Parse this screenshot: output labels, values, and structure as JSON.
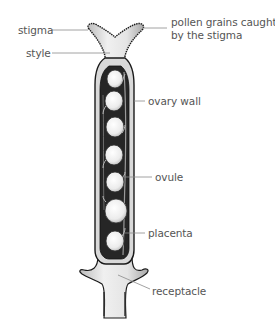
{
  "diagram": {
    "colors": {
      "outline": "#1a1a1a",
      "wall_dark": "#2a2a2a",
      "tissue_light": "#e8e8e8",
      "ovule_fill": "#f4f4f4",
      "leader_line": "#8a8a8a",
      "label_text": "#555555"
    },
    "labels": {
      "stigma": "stigma",
      "style": "style",
      "pollen_line1": "pollen grains caught",
      "pollen_line2": "by the stigma",
      "ovary_wall": "ovary wall",
      "ovule": "ovule",
      "placenta": "placenta",
      "receptacle": "receptacle"
    },
    "ovule_count": 7
  }
}
